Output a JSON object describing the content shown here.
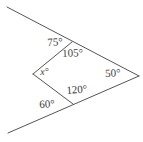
{
  "figure": {
    "type": "geometry-diagram",
    "stroke_color": "#555555",
    "text_color": "#3c3c3c",
    "background_color": "#ffffff",
    "stroke_width": 1,
    "vertices": {
      "left": {
        "x": 33,
        "y": 74
      },
      "top": {
        "x": 72,
        "y": 42
      },
      "right": {
        "x": 139,
        "y": 76
      },
      "bottom": {
        "x": 73,
        "y": 104
      }
    },
    "rays": {
      "upper_left_end": {
        "x": 7,
        "y": 7
      },
      "lower_left_end": {
        "x": 8,
        "y": 133
      }
    },
    "labels": [
      {
        "id": "label-75",
        "text": "75°",
        "position": "exterior-upper-left",
        "value": 75
      },
      {
        "id": "label-105",
        "text": "105°",
        "position": "interior-top",
        "value": 105
      },
      {
        "id": "label-x",
        "text": "x°",
        "position": "interior-left",
        "value": null
      },
      {
        "id": "label-50",
        "text": "50°",
        "position": "interior-right",
        "value": 50
      },
      {
        "id": "label-120",
        "text": "120°",
        "position": "interior-bottom",
        "value": 120
      },
      {
        "id": "label-60",
        "text": "60°",
        "position": "exterior-lower-left",
        "value": 60
      }
    ]
  }
}
